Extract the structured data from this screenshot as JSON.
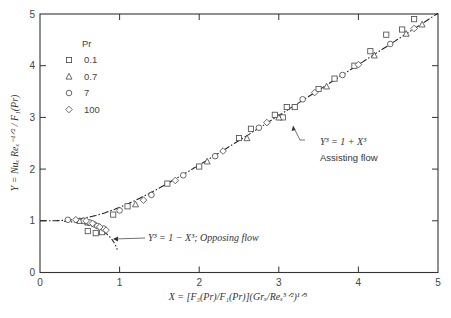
{
  "chart_data": {
    "type": "scatter",
    "title": "",
    "xlabel": "X = [F3(Pr)/F1(Pr)](Grx/Rex^(5/2))^(1/5)",
    "ylabel": "Y = Nux Rex^(-1/2) / F1(Pr)",
    "xlim": [
      0,
      5
    ],
    "ylim": [
      0,
      5
    ],
    "xticks": [
      "0",
      "1",
      "2",
      "3",
      "4",
      "5"
    ],
    "yticks": [
      "0",
      "1",
      "2",
      "3",
      "4",
      "5"
    ],
    "grid": false,
    "legend": {
      "title": "Pr",
      "position": "upper-left",
      "entries": [
        {
          "symbol": "square",
          "label": "0.1"
        },
        {
          "symbol": "triangle",
          "label": "0.7"
        },
        {
          "symbol": "circle",
          "label": "7"
        },
        {
          "symbol": "diamond",
          "label": "100"
        }
      ]
    },
    "curves": [
      {
        "name": "Assisting flow",
        "equation": "Y^3 = 1 + X^3",
        "style": "dash-dot",
        "x_range": [
          0,
          5
        ]
      },
      {
        "name": "Opposing flow",
        "equation": "Y^3 = 1 - X^3",
        "style": "dash-dot",
        "x_range": [
          0.3,
          0.97
        ]
      }
    ],
    "annotations": [
      {
        "text": "Y^3 = 1 + X^3",
        "subtext": "Assisting flow",
        "arrow_to": [
          3.2,
          3.2
        ]
      },
      {
        "text": "Y^3 = 1 - X^3; Opposing flow",
        "arrow_to": [
          0.93,
          0.62
        ]
      }
    ],
    "series": [
      {
        "name": "Pr 0.1",
        "symbol": "square",
        "points": [
          [
            0.6,
            0.8
          ],
          [
            0.7,
            0.76
          ],
          [
            0.78,
            0.78
          ],
          [
            0.92,
            1.12
          ],
          [
            1.1,
            1.28
          ],
          [
            1.6,
            1.72
          ],
          [
            2.0,
            2.05
          ],
          [
            2.5,
            2.6
          ],
          [
            2.65,
            2.78
          ],
          [
            2.95,
            3.05
          ],
          [
            3.1,
            3.2
          ],
          [
            3.05,
            3.0
          ],
          [
            3.2,
            3.2
          ],
          [
            3.5,
            3.55
          ],
          [
            3.7,
            3.75
          ],
          [
            3.95,
            4.0
          ],
          [
            4.15,
            4.28
          ],
          [
            4.35,
            4.6
          ],
          [
            4.55,
            4.7
          ],
          [
            4.7,
            4.9
          ]
        ]
      },
      {
        "name": "Pr 0.7",
        "symbol": "triangle",
        "points": [
          [
            0.5,
            1.0
          ],
          [
            0.6,
            0.97
          ],
          [
            1.2,
            1.32
          ],
          [
            2.1,
            2.15
          ],
          [
            2.6,
            2.6
          ],
          [
            3.0,
            3.0
          ],
          [
            3.6,
            3.6
          ],
          [
            4.2,
            4.2
          ],
          [
            4.6,
            4.62
          ],
          [
            4.8,
            4.8
          ]
        ]
      },
      {
        "name": "Pr 7",
        "symbol": "circle",
        "points": [
          [
            0.35,
            1.02
          ],
          [
            0.55,
            1.0
          ],
          [
            0.62,
            0.97
          ],
          [
            0.68,
            0.93
          ],
          [
            0.72,
            0.9
          ],
          [
            0.8,
            0.85
          ],
          [
            1.0,
            1.2
          ],
          [
            1.4,
            1.5
          ],
          [
            1.8,
            1.88
          ],
          [
            2.2,
            2.25
          ],
          [
            2.75,
            2.8
          ],
          [
            3.3,
            3.35
          ],
          [
            3.8,
            3.82
          ],
          [
            4.4,
            4.42
          ]
        ]
      },
      {
        "name": "Pr 100",
        "symbol": "diamond",
        "points": [
          [
            0.45,
            1.02
          ],
          [
            0.58,
            1.0
          ],
          [
            0.66,
            0.95
          ],
          [
            0.75,
            0.88
          ],
          [
            0.83,
            0.82
          ],
          [
            1.3,
            1.4
          ],
          [
            1.7,
            1.78
          ],
          [
            2.3,
            2.35
          ],
          [
            2.85,
            2.9
          ],
          [
            3.45,
            3.48
          ],
          [
            4.0,
            4.02
          ],
          [
            4.7,
            4.72
          ]
        ]
      }
    ]
  },
  "axes": {
    "x_ticks": [
      "0",
      "1",
      "2",
      "3",
      "4",
      "5"
    ],
    "y_ticks": [
      "0",
      "1",
      "2",
      "3",
      "4",
      "5"
    ]
  },
  "legend": {
    "title": "Pr",
    "items": [
      "0.1",
      "0.7",
      "7",
      "100"
    ]
  },
  "annotations": {
    "assist_eq": "Y³ = 1 + X³",
    "assist_label": "Assisting flow",
    "oppose_eq": "Y³ = 1 − X³; Opposing flow"
  },
  "labels": {
    "x_axis": "X = [F₃(Pr)/F₁(Pr)](Grₓ/Reₓ⁵ᐟ²)¹ᐟ⁵",
    "y_axis": "Y = Nuₓ Reₓ⁻¹ᐟ² / F₁(Pr)"
  }
}
